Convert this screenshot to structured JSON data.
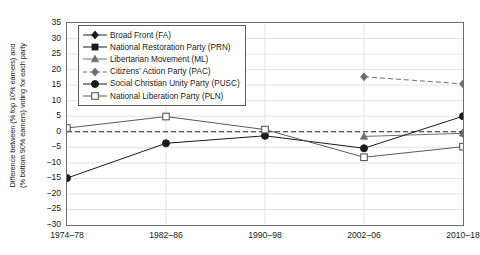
{
  "chart_data": {
    "type": "line",
    "title": "",
    "xlabel": "",
    "ylabel_line1": "Difference between (% top 10% earners) and",
    "ylabel_line2": "(% bottom 90% earners) voting for each party",
    "categories": [
      "1974–78",
      "1982–86",
      "1990–98",
      "2002–06",
      "2010–18"
    ],
    "ylim": [
      -30,
      35
    ],
    "ytick_labels": [
      "35",
      "30",
      "25",
      "20",
      "15",
      "10",
      "5",
      "0",
      "−5",
      "−10",
      "−15",
      "−20",
      "−25",
      "−30"
    ],
    "ytick_values": [
      35,
      30,
      25,
      20,
      15,
      10,
      5,
      0,
      -5,
      -10,
      -15,
      -20,
      -25,
      -30
    ],
    "grid": true,
    "zero_reference_line": 0,
    "legend_position": "upper left",
    "series": [
      {
        "name": "Broad Front (FA)",
        "key": "fa",
        "marker": "diamond-small",
        "color": "#1a1a1a",
        "linestyle": "solid",
        "values": [
          null,
          null,
          null,
          null,
          -0.5
        ]
      },
      {
        "name": "National Restoration Party (PRN)",
        "key": "prn",
        "marker": "square-filled",
        "color": "#1a1a1a",
        "linestyle": "solid",
        "values": [
          null,
          null,
          null,
          null,
          null
        ]
      },
      {
        "name": "Libertarian Movement (ML)",
        "key": "ml",
        "marker": "triangle",
        "color": "#6f6f6f",
        "linestyle": "solid",
        "values": [
          null,
          null,
          null,
          -1.5,
          -0.5
        ]
      },
      {
        "name": "Citizens’ Action Party (PAC)",
        "key": "pac",
        "marker": "diamond-small",
        "color": "#6f6f6f",
        "linestyle": "dashed",
        "values": [
          null,
          null,
          null,
          17.7,
          15.4
        ]
      },
      {
        "name": "Social Christian Unity Party (PUSC)",
        "key": "pusc",
        "marker": "circle-filled",
        "color": "#1a1a1a",
        "linestyle": "solid",
        "values": [
          -14.9,
          -3.7,
          -1.3,
          -5.3,
          5.0
        ]
      },
      {
        "name": "National Liberation Party (PLN)",
        "key": "pln",
        "marker": "square-open",
        "color": "#5a5a5a",
        "linestyle": "solid",
        "values": [
          1.2,
          4.9,
          0.7,
          -8.2,
          -4.8
        ]
      }
    ]
  }
}
